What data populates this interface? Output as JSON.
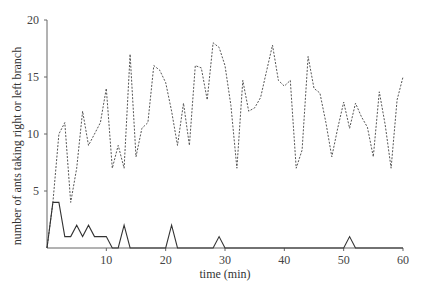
{
  "chart_data": {
    "type": "line",
    "title": "",
    "xlabel": "time (min)",
    "ylabel": "number of ants taking right or left branch",
    "xlim": [
      0,
      60
    ],
    "ylim": [
      0,
      20
    ],
    "xticks": [
      10,
      20,
      30,
      40,
      50,
      60
    ],
    "yticks": [
      5,
      10,
      15,
      20
    ],
    "grid": false,
    "legend": null,
    "x": [
      0,
      1,
      2,
      3,
      4,
      5,
      6,
      7,
      8,
      9,
      10,
      11,
      12,
      13,
      14,
      15,
      16,
      17,
      18,
      19,
      20,
      21,
      22,
      23,
      24,
      25,
      26,
      27,
      28,
      29,
      30,
      31,
      32,
      33,
      34,
      35,
      36,
      37,
      38,
      39,
      40,
      41,
      42,
      43,
      44,
      45,
      46,
      47,
      48,
      49,
      50,
      51,
      52,
      53,
      54,
      55,
      56,
      57,
      58,
      59,
      60
    ],
    "series": [
      {
        "name": "dashed",
        "style": "dashed",
        "color": "#555555",
        "values": [
          0,
          4,
          10,
          11,
          4,
          7,
          12,
          9,
          10,
          11,
          14,
          7,
          9,
          7,
          17,
          8,
          10.5,
          11,
          16,
          15.6,
          14.5,
          12,
          9,
          12.7,
          9,
          16,
          15.8,
          13,
          18,
          17.6,
          16,
          12.5,
          7,
          14.7,
          12,
          12.3,
          13.2,
          15.5,
          17.8,
          14.7,
          14.2,
          14.7,
          7,
          8.6,
          16.8,
          14,
          13.6,
          11,
          8,
          10.5,
          12.8,
          10.5,
          12.7,
          11.5,
          10.6,
          8,
          13.7,
          10.8,
          7,
          13,
          15
        ]
      },
      {
        "name": "solid",
        "style": "solid",
        "color": "#333333",
        "values": [
          0,
          4,
          4,
          1,
          1,
          2,
          1,
          2,
          1,
          1,
          1,
          0,
          0,
          2,
          0,
          0,
          0,
          0,
          0,
          0,
          0,
          2,
          0,
          0,
          0,
          0,
          0,
          0,
          0,
          1,
          0,
          0,
          0,
          0,
          0,
          0,
          0,
          0,
          0,
          0,
          0,
          0,
          0,
          0,
          0,
          0,
          0,
          0,
          0,
          0,
          0,
          1,
          0,
          0,
          0,
          0,
          0,
          0,
          0,
          0,
          0
        ]
      }
    ]
  },
  "axes": {
    "x_title": "time (min)",
    "y_title": "number of ants taking right or left branch",
    "x_tick_labels": [
      "10",
      "20",
      "30",
      "40",
      "50",
      "60"
    ],
    "y_tick_labels": [
      "5",
      "10",
      "15",
      "20"
    ]
  }
}
